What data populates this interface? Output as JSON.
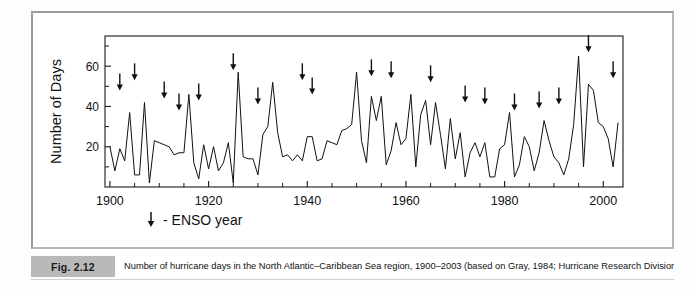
{
  "figure": {
    "number_label": "Fig. 2.12",
    "caption": "Number of hurricane days in the North Atlantic–Caribbean Sea region, 1900–2003 (based on Gray, 1984; Hurricane Research Division, 2003).",
    "frame_color": "#9b9b9b",
    "caption_bar_color": "#b9b9b9"
  },
  "legend": {
    "marker_icon": "down-arrow-icon",
    "text": "- ENSO year"
  },
  "chart_data": {
    "type": "line",
    "title": "",
    "subtitle": "",
    "xlabel": "",
    "ylabel": "Number of Days",
    "xlim": [
      1899,
      2004
    ],
    "ylim": [
      0,
      75
    ],
    "xticks": [
      1900,
      1920,
      1940,
      1960,
      1980,
      2000
    ],
    "xticklabels": [
      "1900",
      "1920",
      "1940",
      "1960",
      "1980",
      "2000"
    ],
    "x_minor_tick_interval": 5,
    "yticks": [
      20,
      40,
      60
    ],
    "yticklabels": [
      "20",
      "40",
      "60"
    ],
    "y_minor_tick_interval": 10,
    "grid": false,
    "legend_position": "below-axes-left",
    "line_color": "#111111",
    "line_width": 1,
    "series": [
      {
        "name": "Hurricane days",
        "x": [
          1900,
          1901,
          1902,
          1903,
          1904,
          1905,
          1906,
          1907,
          1908,
          1909,
          1910,
          1911,
          1912,
          1913,
          1914,
          1915,
          1916,
          1917,
          1918,
          1919,
          1920,
          1921,
          1922,
          1923,
          1924,
          1925,
          1926,
          1927,
          1928,
          1929,
          1930,
          1931,
          1932,
          1933,
          1934,
          1935,
          1936,
          1937,
          1938,
          1939,
          1940,
          1941,
          1942,
          1943,
          1944,
          1945,
          1946,
          1947,
          1948,
          1949,
          1950,
          1951,
          1952,
          1953,
          1954,
          1955,
          1956,
          1957,
          1958,
          1959,
          1960,
          1961,
          1962,
          1963,
          1964,
          1965,
          1966,
          1967,
          1968,
          1969,
          1970,
          1971,
          1972,
          1973,
          1974,
          1975,
          1976,
          1977,
          1978,
          1979,
          1980,
          1981,
          1982,
          1983,
          1984,
          1985,
          1986,
          1987,
          1988,
          1989,
          1990,
          1991,
          1992,
          1993,
          1994,
          1995,
          1996,
          1997,
          1998,
          1999,
          2000,
          2001,
          2002,
          2003
        ],
        "values": [
          20,
          8,
          19,
          13,
          37,
          6,
          6,
          42,
          2,
          23,
          22,
          21,
          20,
          16,
          17,
          17,
          46,
          12,
          4,
          21,
          9,
          20,
          8,
          12,
          22,
          2,
          57,
          15,
          14,
          14,
          6,
          26,
          30,
          52,
          27,
          15,
          16,
          13,
          16,
          13,
          25,
          25,
          13,
          14,
          23,
          22,
          21,
          28,
          29,
          31,
          57,
          23,
          12,
          45,
          33,
          45,
          11,
          18,
          32,
          21,
          24,
          46,
          10,
          36,
          43,
          21,
          42,
          26,
          9,
          34,
          14,
          27,
          5,
          17,
          22,
          15,
          22,
          5,
          5,
          19,
          21,
          37,
          5,
          11,
          25,
          20,
          8,
          17,
          33,
          23,
          15,
          12,
          6,
          14,
          31,
          65,
          10,
          51,
          48,
          32,
          30,
          24,
          10,
          32
        ],
        "units": "days"
      }
    ],
    "annotations": {
      "name": "ENSO years",
      "marker": "down-arrow",
      "years": [
        1902,
        1905,
        1911,
        1914,
        1918,
        1925,
        1930,
        1939,
        1941,
        1953,
        1957,
        1965,
        1972,
        1976,
        1982,
        1987,
        1991,
        1997,
        2002
      ],
      "arrow_tip_values": [
        46,
        51,
        42,
        36,
        41,
        56,
        39,
        51,
        44,
        53,
        52,
        50,
        40,
        39,
        36,
        37,
        39,
        65,
        52
      ]
    }
  }
}
